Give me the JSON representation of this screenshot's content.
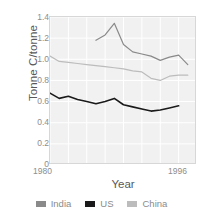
{
  "chart_data": {
    "type": "line",
    "title": "",
    "xlabel": "Year",
    "ylabel": "Tonne C/tonne",
    "xlim": [
      1980,
      1996
    ],
    "ylim": [
      0,
      1.4
    ],
    "grid": true,
    "legend_position": "bottom",
    "xticks": [
      "1980",
      "1996"
    ],
    "yticks": [
      "0",
      "0.2",
      "0.4",
      "0.6",
      "0.8",
      "1.0",
      "1.2",
      "1.4"
    ],
    "series": [
      {
        "name": "India",
        "color": "#8a8a8a",
        "x": [
          1985,
          1986,
          1987,
          1988,
          1989,
          1990,
          1991,
          1992,
          1993,
          1994,
          1995
        ],
        "values": [
          1.18,
          1.23,
          1.34,
          1.14,
          1.07,
          1.05,
          1.03,
          0.99,
          1.02,
          1.04,
          0.95
        ]
      },
      {
        "name": "US",
        "color": "#1a1a1a",
        "x": [
          1980,
          1981,
          1982,
          1983,
          1984,
          1985,
          1986,
          1987,
          1988,
          1989,
          1990,
          1991,
          1992,
          1993,
          1994
        ],
        "values": [
          0.68,
          0.63,
          0.65,
          0.62,
          0.6,
          0.58,
          0.6,
          0.63,
          0.57,
          0.55,
          0.53,
          0.51,
          0.52,
          0.54,
          0.56
        ]
      },
      {
        "name": "China",
        "color": "#bcbcbc",
        "x": [
          1980,
          1981,
          1982,
          1983,
          1984,
          1985,
          1986,
          1987,
          1988,
          1989,
          1990,
          1991,
          1992,
          1993,
          1994,
          1995
        ],
        "values": [
          1.03,
          0.98,
          0.97,
          0.96,
          0.95,
          0.94,
          0.93,
          0.92,
          0.91,
          0.89,
          0.88,
          0.82,
          0.8,
          0.84,
          0.85,
          0.85
        ]
      }
    ]
  },
  "legend": {
    "items": [
      {
        "label": "India",
        "color": "#8a8a8a"
      },
      {
        "label": "US",
        "color": "#1a1a1a"
      },
      {
        "label": "China",
        "color": "#bcbcbc"
      }
    ]
  },
  "colors": {
    "plot_background": "#f1f1f1",
    "gridline": "#ffffff",
    "axis_border": "#d7d7d7",
    "tick_text": "#8d8d8d",
    "axis_title_text": "#58585a"
  }
}
